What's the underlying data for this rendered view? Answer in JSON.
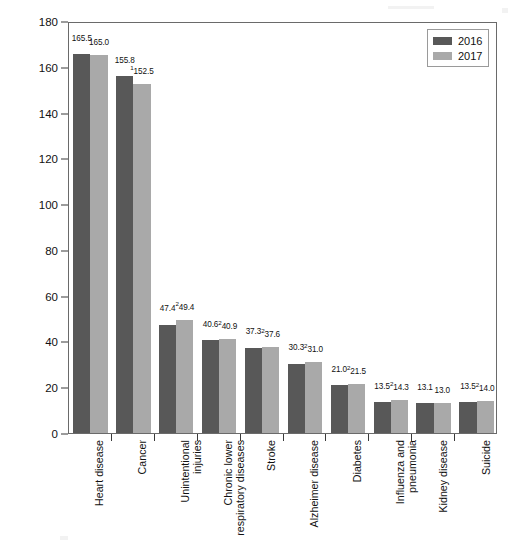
{
  "chart_data": {
    "type": "bar",
    "title": "",
    "xlabel": "",
    "ylabel": "Deaths Per 100,000 U.S. Standard Population",
    "ylim": [
      0,
      180
    ],
    "yticks": [
      0,
      20,
      40,
      60,
      80,
      100,
      120,
      140,
      160,
      180
    ],
    "grid": false,
    "legend_position": "top-right",
    "categories": [
      "Heart disease",
      "Cancer",
      "Unintentional\ninjuries",
      "Chronic lower\nrespiratory diseases",
      "Stroke",
      "Alzheimer disease",
      "Diabetes",
      "Influenza and\npneumonia",
      "Kidney disease",
      "Suicide"
    ],
    "series": [
      {
        "name": "2016",
        "color": "#585858",
        "values": [
          165.5,
          155.8,
          47.4,
          40.6,
          37.3,
          30.3,
          21.0,
          13.5,
          13.1,
          13.5
        ],
        "labels": [
          "165.5",
          "155.8",
          "47.4",
          "40.6",
          "37.3",
          "30.3",
          "21.0",
          "13.5",
          "13.1",
          "13.5"
        ],
        "label_markers": [
          "",
          "",
          "",
          "",
          "",
          "",
          "",
          "",
          "",
          ""
        ]
      },
      {
        "name": "2017",
        "color": "#a9a9a9",
        "values": [
          165.0,
          152.5,
          49.4,
          40.9,
          37.6,
          31.0,
          21.5,
          14.3,
          13.0,
          14.0
        ],
        "labels": [
          "165.0",
          "152.5",
          "49.4",
          "40.9",
          "37.6",
          "31.0",
          "21.5",
          "14.3",
          "13.0",
          "14.0"
        ],
        "label_markers": [
          "",
          "1",
          "2",
          "2",
          "2",
          "2",
          "2",
          "2",
          "",
          "2"
        ]
      }
    ]
  },
  "legend": {
    "entries": [
      {
        "label": "2016",
        "color": "#585858"
      },
      {
        "label": "2017",
        "color": "#a9a9a9"
      }
    ]
  },
  "axis": {
    "y_title": "Deaths Per 100,000 U.S. Standard Population",
    "y_tick_labels": [
      "0",
      "20",
      "40",
      "60",
      "80",
      "100",
      "120",
      "140",
      "160",
      "180"
    ]
  },
  "colors": {
    "series_2016": "#585858",
    "series_2017": "#a9a9a9",
    "frame": "#6a6a6a",
    "text": "#111111",
    "background": "#ffffff"
  }
}
